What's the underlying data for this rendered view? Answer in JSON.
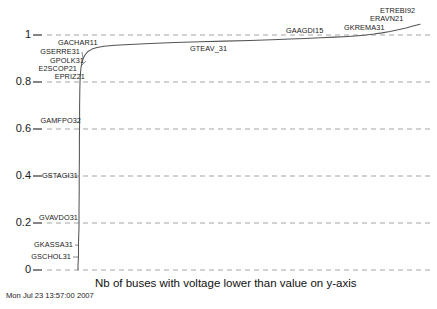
{
  "chart_data": {
    "type": "line",
    "title": "",
    "subtitle": "",
    "xlabel": "Nb of buses with voltage lower than value on y-axis",
    "ylabel": "",
    "ylim": [
      0,
      1.06
    ],
    "xlim": [
      0,
      437
    ],
    "grid": true,
    "legend": "none",
    "y_ticks": [
      "0",
      "0.2",
      "0.4",
      "0.6",
      "0.8",
      "1"
    ],
    "y_tick_values": [
      0,
      0.2,
      0.4,
      0.6,
      0.8,
      1
    ],
    "x_ticks": [],
    "series": [
      {
        "name": "voltage-cdf",
        "points": [
          [
            78,
            0.0
          ],
          [
            78,
            0.02
          ],
          [
            78.5,
            0.06
          ],
          [
            78.5,
            0.12
          ],
          [
            79,
            0.18
          ],
          [
            79,
            0.25
          ],
          [
            79.2,
            0.33
          ],
          [
            79.2,
            0.4
          ],
          [
            79.4,
            0.48
          ],
          [
            79.4,
            0.56
          ],
          [
            79.6,
            0.63
          ],
          [
            79.6,
            0.7
          ],
          [
            79.8,
            0.76
          ],
          [
            80,
            0.8
          ],
          [
            80.4,
            0.835
          ],
          [
            81,
            0.862
          ],
          [
            82,
            0.884
          ],
          [
            83.5,
            0.903
          ],
          [
            85.5,
            0.918
          ],
          [
            88,
            0.93
          ],
          [
            92,
            0.94
          ],
          [
            97,
            0.947
          ],
          [
            104,
            0.952
          ],
          [
            115,
            0.956
          ],
          [
            130,
            0.96
          ],
          [
            150,
            0.964
          ],
          [
            175,
            0.968
          ],
          [
            200,
            0.971
          ],
          [
            225,
            0.974
          ],
          [
            250,
            0.977
          ],
          [
            272,
            0.98
          ],
          [
            290,
            0.983
          ],
          [
            305,
            0.985
          ],
          [
            320,
            0.988
          ],
          [
            335,
            0.991
          ],
          [
            348,
            0.994
          ],
          [
            358,
            0.997
          ],
          [
            366,
            1.0
          ],
          [
            374,
            1.004
          ],
          [
            382,
            1.009
          ],
          [
            390,
            1.015
          ],
          [
            398,
            1.022
          ],
          [
            406,
            1.03
          ],
          [
            413,
            1.038
          ],
          [
            420,
            1.046
          ]
        ]
      }
    ],
    "annotations": [
      {
        "label": "GSCHOL31",
        "x": 79,
        "y": 0.055,
        "anchor": "right",
        "label_px": {
          "x": 19,
          "y": 253
        },
        "leader": true
      },
      {
        "label": "GKASSA31",
        "x": 79,
        "y": 0.105,
        "anchor": "right",
        "label_px": {
          "x": 21,
          "y": 241
        },
        "leader": true
      },
      {
        "label": "GVAVDO31",
        "x": 79,
        "y": 0.205,
        "anchor": "right",
        "label_px": {
          "x": 26,
          "y": 214
        },
        "leader": false
      },
      {
        "label": "GSTAGI31",
        "x": 79,
        "y": 0.395,
        "anchor": "right",
        "label_px": {
          "x": 26,
          "y": 172
        },
        "leader": false
      },
      {
        "label": "GAMFPO32",
        "x": 79,
        "y": 0.615,
        "anchor": "right",
        "label_px": {
          "x": 29,
          "y": 117
        },
        "leader": false
      },
      {
        "label": "EPRIZ21",
        "x": 79.7,
        "y": 0.79,
        "anchor": "right",
        "label_px": {
          "x": 33,
          "y": 73
        },
        "leader": false
      },
      {
        "label": "E2SCOP21",
        "x": 79.6,
        "y": 0.83,
        "anchor": "right",
        "label_px": {
          "x": 25,
          "y": 65
        },
        "leader": false
      },
      {
        "label": "GPOLK31",
        "x": 81,
        "y": 0.868,
        "anchor": "right",
        "label_px": {
          "x": 32,
          "y": 57
        },
        "leader": true
      },
      {
        "label": "GSERRE31",
        "x": 83,
        "y": 0.9,
        "anchor": "right",
        "label_px": {
          "x": 28,
          "y": 48
        },
        "leader": true
      },
      {
        "label": "GACHAR11",
        "x": 95,
        "y": 0.945,
        "anchor": "left",
        "label_px": {
          "x": 58,
          "y": 39
        },
        "leader": false
      },
      {
        "label": "GTEAV_31",
        "x": 215,
        "y": 0.972,
        "anchor": "left",
        "label_px": {
          "x": 190,
          "y": 45
        },
        "leader": false
      },
      {
        "label": "GAAGDI15",
        "x": 310,
        "y": 0.986,
        "anchor": "left",
        "label_px": {
          "x": 286,
          "y": 27
        },
        "leader": false
      },
      {
        "label": "GKREMA31",
        "x": 368,
        "y": 1.001,
        "anchor": "left",
        "label_px": {
          "x": 344,
          "y": 24
        },
        "leader": false
      },
      {
        "label": "ERAVN21",
        "x": 396,
        "y": 1.02,
        "anchor": "left",
        "label_px": {
          "x": 370,
          "y": 15
        },
        "leader": false
      },
      {
        "label": "ETREBI92",
        "x": 412,
        "y": 1.036,
        "anchor": "left",
        "label_px": {
          "x": 380,
          "y": 7
        },
        "leader": false
      }
    ],
    "colors": {
      "background": "#ffffff",
      "curve": "#555555",
      "gridline": "#9a9a9a",
      "text": "#1a1a1a"
    }
  },
  "footer": {
    "timestamp": "Mon Jul 23 13:57:00 2007"
  }
}
